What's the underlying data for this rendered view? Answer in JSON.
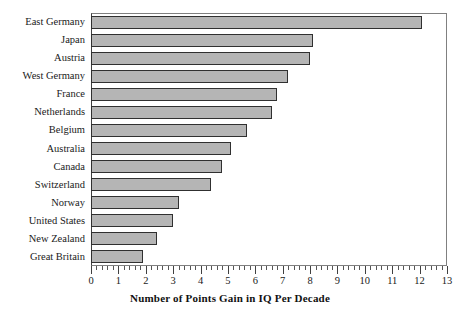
{
  "chart_data": {
    "type": "bar",
    "orientation": "horizontal",
    "title": "",
    "xlabel": "Number of Points Gain in IQ Per Decade",
    "ylabel": "",
    "xlim": [
      0,
      13
    ],
    "xticks": [
      0,
      1,
      2,
      3,
      4,
      5,
      6,
      7,
      8,
      9,
      10,
      11,
      12,
      13
    ],
    "minor_tick_step": 0.2,
    "grid": false,
    "legend": null,
    "bar_fill_color": "#b5b5b5",
    "bar_edge_color": "#303030",
    "frame_color": "#808080",
    "background_color": "#ffffff",
    "categories": [
      "East Germany",
      "Japan",
      "Austria",
      "West Germany",
      "France",
      "Netherlands",
      "Belgium",
      "Australia",
      "Canada",
      "Switzerland",
      "Norway",
      "United States",
      "New Zealand",
      "Great Britain"
    ],
    "values": [
      12.1,
      8.1,
      8.0,
      7.2,
      6.8,
      6.6,
      5.7,
      5.1,
      4.8,
      4.4,
      3.2,
      3.0,
      2.4,
      1.9
    ]
  }
}
